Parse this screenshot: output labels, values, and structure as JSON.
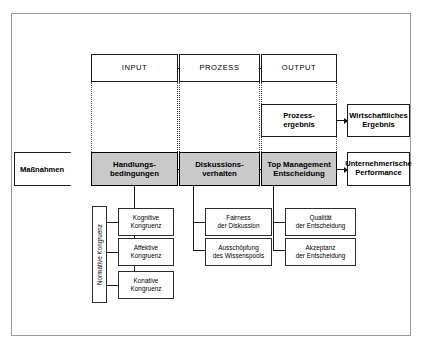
{
  "figure": {
    "title_band": {
      "input": "INPUT",
      "prozess": "PROZESS",
      "output": "OUTPUT"
    },
    "trigger": {
      "label": "Maßnahmen"
    },
    "core_chain": [
      {
        "id": "handlungsbedingungen",
        "label": "Handlungs-\nbedingungen"
      },
      {
        "id": "diskussionsverhalten",
        "label": "Diskussions-\nverhalten"
      },
      {
        "id": "top-management-entscheidung",
        "label": "Top Management\nEntscheidung"
      }
    ],
    "intermediate_result": {
      "label": "Prozess-\nergebnis"
    },
    "outcomes": [
      {
        "id": "wirtschaftliches-ergebnis",
        "label": "Wirtschaftliches\nErgebnis"
      },
      {
        "id": "unternehmerische-performance",
        "label": "Unternehmerische\nPerformance"
      }
    ],
    "bracket_label": {
      "label": "Normative Kongruenz"
    },
    "input_indicators": [
      {
        "id": "kognitive-kongruenz",
        "label": "Kognitive\nKongruenz"
      },
      {
        "id": "affektive-kongruenz",
        "label": "Affektive\nKongruenz"
      },
      {
        "id": "konative-kongruenz",
        "label": "Konative\nKongruenz"
      }
    ],
    "process_indicators": [
      {
        "id": "fairness-der-diskussion",
        "label": "Fairness\nder Diskussion"
      },
      {
        "id": "ausschoepfung-des-wissenspools",
        "label": "Ausschöpfung\ndes Wissenspools"
      }
    ],
    "output_indicators": [
      {
        "id": "qualitaet-der-entscheidung",
        "label": "Qualität\nder Entscheidung"
      },
      {
        "id": "akzeptanz-der-entscheidung",
        "label": "Akzeptanz\nder Entscheidung"
      }
    ],
    "colors": {
      "core_fill": "#c9c9c9",
      "box_border": "#1a1a1a",
      "frame_border": "#9a9a9a",
      "background": "#ffffff"
    }
  }
}
